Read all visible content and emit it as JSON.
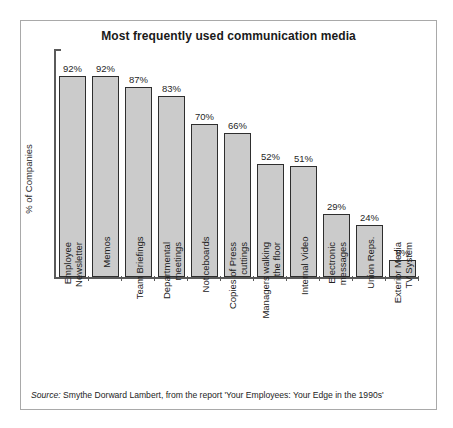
{
  "figure": {
    "title": "Most frequently used communication media",
    "source_label": "Source:",
    "source_text": " Smythe Dorward Lambert, from the report 'Your Employees: Your Edge in the 1990s'"
  },
  "chart_data": {
    "type": "bar",
    "title": "Most frequently used communication media",
    "xlabel": "",
    "ylabel": "% of Companies",
    "ylim": [
      0,
      100
    ],
    "grid": false,
    "legend": "none",
    "value_suffix": "%",
    "categories": [
      "Employee Newsletter",
      "Memos",
      "Team Briefings",
      "Departmental meetings",
      "Noticeboards",
      "Copies of Press cuttings",
      "Managers walking the floor",
      "Internal Video",
      "Electronic messages",
      "Union Reps.",
      "Exterior Media TV System"
    ],
    "category_lines": [
      "Employee\nNewsletter",
      "Memos",
      "Team Briefings",
      "Departmental\nmeetings",
      "Noticeboards",
      "Copies of Press\ncuttings",
      "Managers walking\nthe floor",
      "Internal Video",
      "Electronic\nmessages",
      "Union Reps.",
      "Exterior Media\nTV System"
    ],
    "values": [
      92,
      92,
      87,
      83,
      70,
      66,
      52,
      51,
      29,
      24,
      8
    ],
    "value_labels": [
      "92%",
      "92%",
      "87%",
      "83%",
      "70%",
      "66%",
      "52%",
      "51%",
      "29%",
      "24%",
      "8%"
    ],
    "bar_fill": "#cbcbcb",
    "bar_edge": "#2e2e2e",
    "axis_color": "#5a5a5a"
  }
}
